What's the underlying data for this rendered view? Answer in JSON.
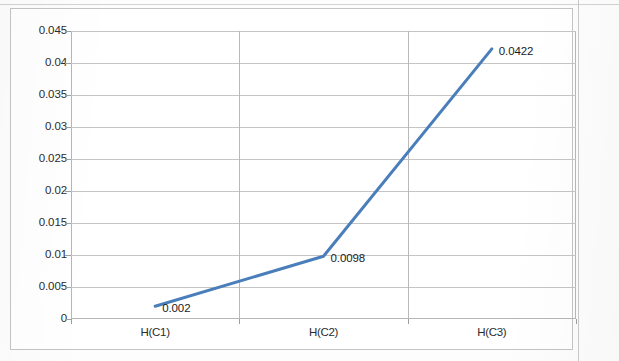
{
  "chart_data": {
    "type": "line",
    "title": "",
    "subtitle": "",
    "xlabel": "",
    "ylabel": "",
    "categories": [
      "H(C1)",
      "H(C2)",
      "H(C3)"
    ],
    "values": [
      0.002,
      0.0098,
      0.0422
    ],
    "point_labels": [
      "0.002",
      "0.0098",
      "0.0422"
    ],
    "series": [
      {
        "name": "Series1",
        "values": [
          0.002,
          0.0098,
          0.0422
        ],
        "color": "#4a7ebb"
      }
    ],
    "ylim": [
      0,
      0.045
    ],
    "ytick_step": 0.005,
    "ytick_labels": [
      "0.045",
      "0.04",
      "0.035",
      "0.03",
      "0.025",
      "0.02",
      "0.015",
      "0.01",
      "0.005",
      "0"
    ],
    "ytick_values": [
      0.045,
      0.04,
      0.035,
      0.03,
      0.025,
      0.02,
      0.015,
      0.01,
      0.005,
      0
    ],
    "grid": {
      "horizontal": true,
      "vertical": true
    },
    "legend": {
      "visible": false,
      "position": "none"
    },
    "data_labels_visible": true,
    "markers_visible": false,
    "line_color": "#4a7ebb",
    "line_width_px": 3,
    "gridline_color": "#c5c5c5",
    "plot_border_color": "#b6b6b6",
    "chart_border_color": "#c4c4c4",
    "background_color": "#ffffff"
  },
  "axes": {
    "y": {
      "ticks": [
        {
          "label": "0.045",
          "value": 0.045
        },
        {
          "label": "0.04",
          "value": 0.04
        },
        {
          "label": "0.035",
          "value": 0.035
        },
        {
          "label": "0.03",
          "value": 0.03
        },
        {
          "label": "0.025",
          "value": 0.025
        },
        {
          "label": "0.02",
          "value": 0.02
        },
        {
          "label": "0.015",
          "value": 0.015
        },
        {
          "label": "0.01",
          "value": 0.01
        },
        {
          "label": "0.005",
          "value": 0.005
        },
        {
          "label": "0",
          "value": 0
        }
      ]
    },
    "x": {
      "ticks": [
        {
          "label": "H(C1)"
        },
        {
          "label": "H(C2)"
        },
        {
          "label": "H(C3)"
        }
      ]
    }
  }
}
